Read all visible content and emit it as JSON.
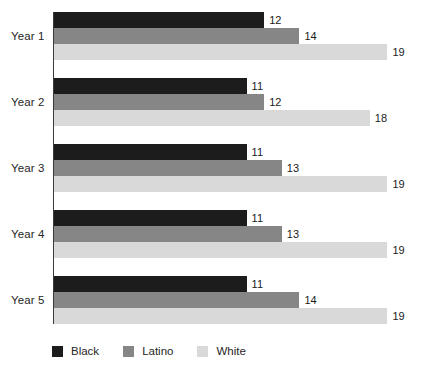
{
  "chart_data": {
    "type": "bar",
    "orientation": "horizontal",
    "title": "",
    "xlabel": "",
    "ylabel": "",
    "categories": [
      "Year 1",
      "Year 2",
      "Year 3",
      "Year 4",
      "Year 5"
    ],
    "series": [
      {
        "name": "Black",
        "color": "#1c1c1c",
        "values": [
          12,
          11,
          11,
          11,
          11
        ]
      },
      {
        "name": "Latino",
        "color": "#868686",
        "values": [
          14,
          12,
          13,
          13,
          14
        ]
      },
      {
        "name": "White",
        "color": "#d9d9d9",
        "values": [
          19,
          18,
          19,
          19,
          19
        ]
      }
    ],
    "xlim": [
      0,
      20
    ],
    "grid": false,
    "value_labels": true,
    "legend_position": "bottom-left",
    "axis_color": "#3a3a3a"
  }
}
